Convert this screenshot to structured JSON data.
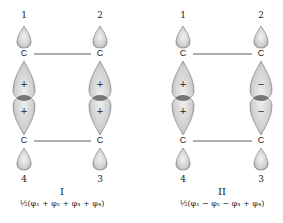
{
  "diagrams": [
    {
      "id": "I",
      "numeral": "I",
      "formula": "½(φ₁ + φ₂ + φ₃ + φ₄)",
      "atoms": {
        "top_left": "1",
        "top_right": "2",
        "bottom_left": "4",
        "bottom_right": "3"
      },
      "carbon_label": "C",
      "signs": {
        "left_upper": "+",
        "left_lower": "+",
        "right_upper": "+",
        "right_lower": "+"
      }
    },
    {
      "id": "II",
      "numeral": "II",
      "formula": "½(φ₁ − φ₂ − φ₃ + φ₄)",
      "atoms": {
        "top_left": "1",
        "top_right": "2",
        "bottom_left": "4",
        "bottom_right": "3"
      },
      "carbon_label": "C",
      "signs": {
        "left_upper": "+",
        "left_lower": "+",
        "right_upper": "−",
        "right_lower": "−"
      }
    }
  ],
  "colors": {
    "lobe_fill": "#d9d9d9",
    "lobe_stroke": "#6a6a6a",
    "waist": "#4a4a4a",
    "bond": "#333333"
  }
}
